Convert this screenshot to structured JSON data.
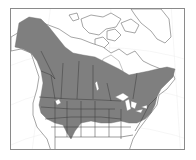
{
  "map": {
    "title": "",
    "region": "North America",
    "range_color": "#7f7f7f",
    "land_color": "#ffffff",
    "border_color": "#3a3a3a",
    "frame_color": "#8a8a8a",
    "legend": []
  }
}
